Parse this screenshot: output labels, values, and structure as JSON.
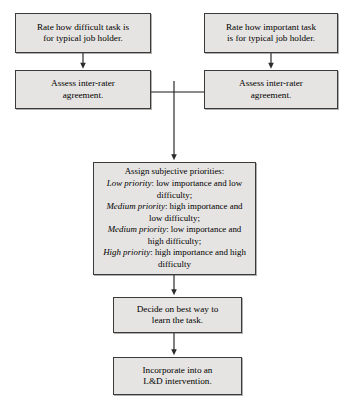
{
  "diagram": {
    "style": {
      "node_fill": "#e6e4e2",
      "node_border": "#3a3a3a",
      "connector_color": "#2b2b2b",
      "background": "#ffffff"
    },
    "nodes": {
      "rate_difficult": {
        "label": "Rate how difficult task is for typical job holder.",
        "line1": "Rate how difficult task is",
        "line2": "for typical job holder."
      },
      "rate_important": {
        "label": "Rate how important task is for typical job holder.",
        "line1": "Rate how important task",
        "line2": "is for typical job holder."
      },
      "assess_left": {
        "label": "Assess inter-rater agreement.",
        "line1": "Assess inter-rater",
        "line2": "agreement."
      },
      "assess_right": {
        "label": "Assess inter-rater agreement.",
        "line1": "Assess inter-rater",
        "line2": "agreement."
      },
      "priorities": {
        "heading": "Assign subjective priorities:",
        "items": [
          {
            "emphasis": "Low priority",
            "rest": ": low importance and low difficulty;"
          },
          {
            "emphasis": "Medium priority",
            "rest": ": high importance and low difficulty;"
          },
          {
            "emphasis": "Medium priority",
            "rest": ": low importance and high difficulty;"
          },
          {
            "emphasis": "High priority",
            "rest": ": high importance and high difficulty"
          }
        ]
      },
      "decide": {
        "label": "Decide on best way to learn the task.",
        "line1": "Decide on best way to",
        "line2": "learn the task."
      },
      "incorporate": {
        "label": "Incorporate into an L&D intervention.",
        "line1": "Incorporate into an",
        "line2": "L&D intervention."
      }
    },
    "edges": [
      {
        "name": "rate-difficult-to-assess-left",
        "from": "rate_difficult",
        "to": "assess_left",
        "arrow": true
      },
      {
        "name": "rate-important-to-assess-right",
        "from": "rate_important",
        "to": "assess_right",
        "arrow": true
      },
      {
        "name": "assess-left-to-junction",
        "from": "assess_left",
        "to": "junction",
        "arrow": false
      },
      {
        "name": "assess-right-to-junction",
        "from": "assess_right",
        "to": "junction",
        "arrow": false
      },
      {
        "name": "junction-to-priorities",
        "from": "junction",
        "to": "priorities",
        "arrow": true
      },
      {
        "name": "priorities-to-decide",
        "from": "priorities",
        "to": "decide",
        "arrow": true
      },
      {
        "name": "decide-to-incorporate",
        "from": "decide",
        "to": "incorporate",
        "arrow": true
      }
    ]
  }
}
